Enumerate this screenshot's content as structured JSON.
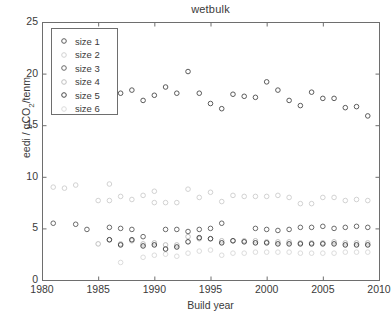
{
  "chart_data": {
    "type": "scatter",
    "title": "wetbulk",
    "xlabel": "Build year",
    "ylabel_text": "eedi / gCO",
    "ylabel_sub": "2",
    "ylabel_tail": "/tenm",
    "ylabel_full": "eedi / gCO2/tenm",
    "xlim": [
      1980,
      2010
    ],
    "ylim": [
      0,
      25
    ],
    "xticks": [
      1980,
      1985,
      1990,
      1995,
      2000,
      2005,
      2010
    ],
    "yticks": [
      0,
      5,
      10,
      15,
      20,
      25
    ],
    "grid": false,
    "legend_position": "upper-left",
    "marker": "open-circle",
    "series": [
      {
        "name": "size 1",
        "color": "#5b5b5b",
        "marker_size": 4.6,
        "points": [
          [
            1987,
            18.1
          ],
          [
            1988,
            18.4
          ],
          [
            1989,
            17.4
          ],
          [
            1990,
            17.9
          ],
          [
            1991,
            18.7
          ],
          [
            1992,
            18.1
          ],
          [
            1993,
            20.2
          ],
          [
            1994,
            18.1
          ],
          [
            1995,
            17.1
          ],
          [
            1996,
            16.6
          ],
          [
            1997,
            18.0
          ],
          [
            1998,
            17.8
          ],
          [
            1999,
            17.7
          ],
          [
            2000,
            19.2
          ],
          [
            2001,
            18.4
          ],
          [
            2002,
            17.4
          ],
          [
            2003,
            16.9
          ],
          [
            2004,
            18.2
          ],
          [
            2005,
            17.6
          ],
          [
            2006,
            17.6
          ],
          [
            2007,
            16.7
          ],
          [
            2008,
            16.8
          ],
          [
            2009,
            15.9
          ]
        ]
      },
      {
        "name": "size 2",
        "color": "#d2d2d2",
        "marker_size": 4.6,
        "points": [
          [
            1981,
            9.0
          ],
          [
            1982,
            8.9
          ],
          [
            1983,
            9.2
          ],
          [
            1985,
            7.7
          ],
          [
            1986,
            9.3
          ],
          [
            1986,
            7.7
          ],
          [
            1987,
            8.1
          ],
          [
            1988,
            7.8
          ],
          [
            1989,
            8.2
          ],
          [
            1990,
            8.6
          ],
          [
            1990,
            7.5
          ],
          [
            1991,
            7.5
          ],
          [
            1992,
            7.5
          ],
          [
            1993,
            8.8
          ],
          [
            1994,
            8.0
          ],
          [
            1995,
            8.5
          ],
          [
            1996,
            7.6
          ],
          [
            1997,
            8.2
          ],
          [
            1998,
            8.1
          ],
          [
            1999,
            8.1
          ],
          [
            2000,
            8.1
          ],
          [
            2001,
            8.2
          ],
          [
            2002,
            8.0
          ],
          [
            2003,
            7.4
          ],
          [
            2004,
            7.4
          ],
          [
            2005,
            8.0
          ],
          [
            2006,
            8.0
          ],
          [
            2007,
            7.7
          ],
          [
            2008,
            7.8
          ],
          [
            2009,
            7.7
          ]
        ]
      },
      {
        "name": "size 3",
        "color": "#6a6a6a",
        "marker_size": 4.6,
        "points": [
          [
            1981,
            5.5
          ],
          [
            1983,
            5.4
          ],
          [
            1984,
            4.9
          ],
          [
            1986,
            5.1
          ],
          [
            1987,
            5.0
          ],
          [
            1988,
            4.9
          ],
          [
            1989,
            4.2
          ],
          [
            1991,
            4.9
          ],
          [
            1992,
            4.9
          ],
          [
            1993,
            4.7
          ],
          [
            1994,
            4.9
          ],
          [
            1995,
            5.0
          ],
          [
            1996,
            5.5
          ],
          [
            1999,
            5.0
          ],
          [
            2000,
            4.9
          ],
          [
            2001,
            4.8
          ],
          [
            2002,
            4.9
          ],
          [
            2003,
            5.1
          ],
          [
            2004,
            5.1
          ],
          [
            2005,
            5.2
          ],
          [
            2006,
            5.0
          ],
          [
            2007,
            5.1
          ],
          [
            2008,
            5.2
          ],
          [
            2009,
            5.1
          ]
        ]
      },
      {
        "name": "size 4",
        "color": "#c0c0c0",
        "marker_size": 4.6,
        "points": [
          [
            1985,
            3.5
          ],
          [
            1986,
            3.9
          ],
          [
            1987,
            3.5
          ],
          [
            1988,
            3.8
          ],
          [
            1989,
            3.5
          ],
          [
            1990,
            3.6
          ],
          [
            1991,
            3.4
          ],
          [
            1992,
            3.4
          ],
          [
            1993,
            4.2
          ],
          [
            1994,
            4.0
          ],
          [
            1995,
            4.0
          ],
          [
            1996,
            3.8
          ],
          [
            1997,
            3.8
          ],
          [
            1998,
            3.8
          ],
          [
            1999,
            3.8
          ],
          [
            2000,
            3.7
          ],
          [
            2001,
            3.7
          ],
          [
            2002,
            3.7
          ],
          [
            2003,
            3.6
          ],
          [
            2004,
            3.6
          ],
          [
            2005,
            3.6
          ],
          [
            2006,
            3.7
          ],
          [
            2007,
            3.6
          ],
          [
            2008,
            3.6
          ],
          [
            2009,
            3.6
          ]
        ]
      },
      {
        "name": "size 5",
        "color": "#4a4a4a",
        "marker_size": 4.6,
        "points": [
          [
            1986,
            3.9
          ],
          [
            1987,
            3.4
          ],
          [
            1988,
            3.9
          ],
          [
            1989,
            3.3
          ],
          [
            1990,
            3.4
          ],
          [
            1991,
            3.0
          ],
          [
            1992,
            3.2
          ],
          [
            1993,
            3.7
          ],
          [
            1994,
            4.1
          ],
          [
            1995,
            4.0
          ],
          [
            1996,
            3.6
          ],
          [
            1997,
            3.8
          ],
          [
            1998,
            3.7
          ],
          [
            1999,
            3.6
          ],
          [
            2000,
            3.6
          ],
          [
            2001,
            3.5
          ],
          [
            2002,
            3.5
          ],
          [
            2003,
            3.5
          ],
          [
            2004,
            3.5
          ],
          [
            2005,
            3.5
          ],
          [
            2006,
            3.5
          ],
          [
            2007,
            3.4
          ],
          [
            2008,
            3.4
          ],
          [
            2009,
            3.4
          ]
        ]
      },
      {
        "name": "size 6",
        "color": "#dcdcdc",
        "marker_size": 4.6,
        "points": [
          [
            1987,
            1.7
          ],
          [
            1989,
            2.2
          ],
          [
            1990,
            2.4
          ],
          [
            1991,
            2.5
          ],
          [
            1992,
            2.3
          ],
          [
            1993,
            2.6
          ],
          [
            1994,
            2.8
          ],
          [
            1995,
            2.9
          ],
          [
            1996,
            2.4
          ],
          [
            1997,
            2.6
          ],
          [
            1998,
            2.6
          ],
          [
            1999,
            2.7
          ],
          [
            2000,
            2.7
          ],
          [
            2001,
            2.7
          ],
          [
            2002,
            2.7
          ],
          [
            2003,
            2.6
          ],
          [
            2004,
            2.6
          ],
          [
            2005,
            2.6
          ],
          [
            2006,
            2.6
          ],
          [
            2007,
            2.7
          ],
          [
            2008,
            2.7
          ],
          [
            2009,
            2.7
          ]
        ]
      }
    ]
  },
  "legend": {
    "items": [
      {
        "label": "size 1"
      },
      {
        "label": "size 2"
      },
      {
        "label": "size 3"
      },
      {
        "label": "size 4"
      },
      {
        "label": "size 5"
      },
      {
        "label": "size 6"
      }
    ]
  },
  "axes": {
    "frame_color": "#6e6e6e",
    "text_color": "#3a3a3a"
  }
}
